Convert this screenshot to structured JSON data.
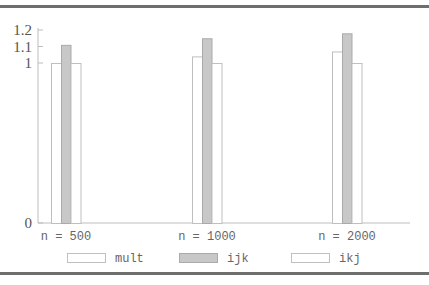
{
  "chart_data": {
    "type": "bar",
    "title": "",
    "xlabel": "",
    "ylabel": "",
    "categories": [
      "n = 500",
      "n = 1000",
      "n = 2000"
    ],
    "series": [
      {
        "name": "mult",
        "values": [
          1.0,
          1.04,
          1.07
        ],
        "fill": "#ffffff",
        "stroke": "#bfbfbf"
      },
      {
        "name": "ijk",
        "values": [
          1.11,
          1.15,
          1.18
        ],
        "fill": "#c8c8c8",
        "stroke": "#aaaaaa"
      },
      {
        "name": "ikj",
        "values": [
          1.0,
          1.0,
          1.0
        ],
        "fill": "#ffffff",
        "stroke": "#bfbfbf"
      }
    ],
    "yticks": [
      "0",
      "1",
      "1.1",
      "1.2"
    ],
    "ylim": [
      0,
      1.2
    ],
    "axis_note": "non-linear y-axis: 0→1 compressed, 1→1.2 expanded",
    "grid": false,
    "legend_position": "bottom"
  }
}
